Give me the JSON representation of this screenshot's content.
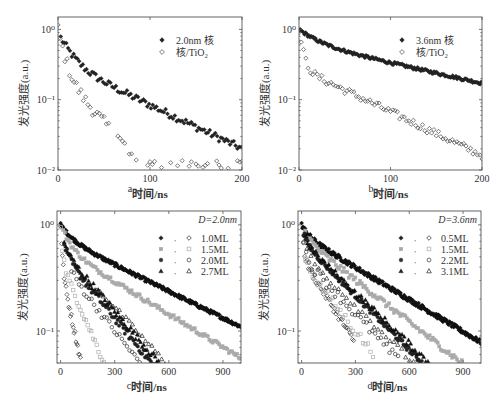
{
  "chart_data": [
    {
      "id": "a",
      "type": "scatter",
      "panel_label": "a",
      "title": "",
      "xlabel": "时间/ns",
      "ylabel": "发光强度(a.u.)",
      "xscale": "linear",
      "yscale": "log",
      "xlim": [
        0,
        200
      ],
      "ylim": [
        0.01,
        1.5
      ],
      "xticks": [
        0,
        100,
        200
      ],
      "yticks": [
        {
          "value": 1,
          "label": "10⁰"
        },
        {
          "value": 0.1,
          "label": "10⁻¹"
        },
        {
          "value": 0.01,
          "label": "10⁻²"
        }
      ],
      "legend_position": "upper right",
      "annotation": "",
      "series": [
        {
          "name": "2.0nm 核",
          "marker": "filled-diamond",
          "color": "#222222",
          "decay": {
            "a1": 0.55,
            "t1": 12,
            "a2": 0.35,
            "t2": 70,
            "start": 3,
            "end": 200,
            "step": 2,
            "noise": 0.12
          }
        },
        {
          "name": "核/TiO₂",
          "marker": "open-diamond",
          "color": "#444444",
          "decay": {
            "a1": 0.75,
            "t1": 6,
            "a2": 0.25,
            "t2": 30,
            "start": 0,
            "end": 200,
            "step": 2.5,
            "noise": 0.2,
            "floor": 0.0105,
            "sparse_after": 55
          }
        }
      ]
    },
    {
      "id": "b",
      "type": "scatter",
      "panel_label": "b",
      "title": "",
      "xlabel": "时间/ns",
      "ylabel": "发光强度(a.u.)",
      "xscale": "linear",
      "yscale": "log",
      "xlim": [
        0,
        200
      ],
      "ylim": [
        0.01,
        1.5
      ],
      "xticks": [
        0,
        100,
        200
      ],
      "yticks": [
        {
          "value": 1,
          "label": "10⁰"
        },
        {
          "value": 0.1,
          "label": "10⁻¹"
        },
        {
          "value": 0.01,
          "label": "10⁻²"
        }
      ],
      "legend_position": "upper right",
      "annotation": "",
      "series": [
        {
          "name": "3.6nm 核",
          "marker": "filled-diamond",
          "color": "#222222",
          "decay": {
            "a1": 0.35,
            "t1": 20,
            "a2": 0.65,
            "t2": 150,
            "start": 0,
            "end": 200,
            "step": 1.2,
            "noise": 0.05
          }
        },
        {
          "name": "核/TiO₂",
          "marker": "open-diamond",
          "color": "#444444",
          "decay": {
            "a1": 0.72,
            "t1": 4,
            "a2": 0.28,
            "t2": 70,
            "start": 0,
            "end": 200,
            "step": 2.5,
            "noise": 0.12
          }
        }
      ]
    },
    {
      "id": "c",
      "type": "scatter",
      "panel_label": "c",
      "title": "",
      "xlabel": "时间/ns",
      "ylabel": "发光强度(a.u.)",
      "xscale": "linear",
      "yscale": "log",
      "xlim": [
        -20,
        1000
      ],
      "ylim": [
        0.05,
        1.35
      ],
      "xticks": [
        0,
        300,
        600,
        900
      ],
      "yticks": [
        {
          "value": 1,
          "label": "10⁰"
        },
        {
          "value": 0.1,
          "label": "10⁻¹"
        }
      ],
      "legend_position": "upper right",
      "annotation": "D=2.0nm",
      "legend_rows": [
        {
          "label": "1.0ML",
          "filled": "filled-diamond",
          "open": "open-diamond",
          "color": "#222222"
        },
        {
          "label": "1.5ML",
          "filled": "filled-square",
          "open": "open-square",
          "color": "#aaaaaa"
        },
        {
          "label": "2.0ML",
          "filled": "filled-circle",
          "open": "open-circle",
          "color": "#333333"
        },
        {
          "label": "2.7ML",
          "filled": "filled-triangle",
          "open": "open-triangle",
          "color": "#222222"
        }
      ],
      "series": [
        {
          "name": "1.0ML core",
          "marker": "filled-diamond",
          "color": "#111111",
          "decay": {
            "a1": 0.25,
            "t1": 60,
            "a2": 0.75,
            "t2": 520,
            "start": 0,
            "end": 1000,
            "step": 4,
            "noise": 0.04
          }
        },
        {
          "name": "1.0ML core/TiO₂",
          "marker": "open-diamond",
          "color": "#333333",
          "decay": {
            "a1": 0.6,
            "t1": 8,
            "a2": 0.4,
            "t2": 55,
            "start": 0,
            "end": 115,
            "step": 5,
            "noise": 0.08
          }
        },
        {
          "name": "1.5ML core",
          "marker": "filled-square",
          "color": "#aaaaaa",
          "decay": {
            "a1": 0.4,
            "t1": 50,
            "a2": 0.6,
            "t2": 420,
            "start": 15,
            "end": 1000,
            "step": 9,
            "noise": 0.05
          }
        },
        {
          "name": "1.5ML core/TiO₂",
          "marker": "open-square",
          "color": "#b0b0b0",
          "decay": {
            "a1": 0.55,
            "t1": 10,
            "a2": 0.45,
            "t2": 110,
            "start": 0,
            "end": 320,
            "step": 10,
            "noise": 0.08
          }
        },
        {
          "name": "2.0ML core",
          "marker": "filled-circle",
          "color": "#222222",
          "decay": {
            "a1": 0.35,
            "t1": 25,
            "a2": 0.55,
            "t2": 210,
            "start": 20,
            "end": 560,
            "step": 8,
            "noise": 0.08
          }
        },
        {
          "name": "2.0ML core/TiO₂",
          "marker": "open-circle",
          "color": "#333333",
          "decay": {
            "a1": 0.4,
            "t1": 25,
            "a2": 0.45,
            "t2": 200,
            "start": 60,
            "end": 580,
            "step": 14,
            "noise": 0.08
          }
        },
        {
          "name": "2.7ML core",
          "marker": "filled-triangle",
          "color": "#111111",
          "decay": {
            "a1": 0.3,
            "t1": 25,
            "a2": 0.6,
            "t2": 220,
            "start": 20,
            "end": 600,
            "step": 9,
            "noise": 0.08
          }
        },
        {
          "name": "2.7ML core/TiO₂",
          "marker": "open-triangle",
          "color": "#222222",
          "decay": {
            "a1": 0.3,
            "t1": 25,
            "a2": 0.6,
            "t2": 235,
            "start": 200,
            "end": 680,
            "step": 18,
            "noise": 0.06
          }
        }
      ]
    },
    {
      "id": "d",
      "type": "scatter",
      "panel_label": "d",
      "title": "",
      "xlabel": "时间/ns",
      "ylabel": "发光强度(a.u.)",
      "xscale": "linear",
      "yscale": "log",
      "xlim": [
        -20,
        1000
      ],
      "ylim": [
        0.05,
        1.35
      ],
      "xticks": [
        0,
        300,
        600,
        900
      ],
      "yticks": [
        {
          "value": 1,
          "label": "10⁰"
        },
        {
          "value": 0.1,
          "label": "10⁻¹"
        }
      ],
      "legend_position": "upper right",
      "annotation": "D=3.6nm",
      "legend_rows": [
        {
          "label": "0.5ML",
          "filled": "filled-diamond",
          "open": "open-diamond",
          "color": "#222222"
        },
        {
          "label": "1.5ML",
          "filled": "filled-square",
          "open": "open-square",
          "color": "#aaaaaa"
        },
        {
          "label": "2.2ML",
          "filled": "filled-circle",
          "open": "open-circle",
          "color": "#333333"
        },
        {
          "label": "3.1ML",
          "filled": "filled-triangle",
          "open": "open-triangle",
          "color": "#222222"
        }
      ],
      "series": [
        {
          "name": "0.5ML core",
          "marker": "filled-diamond",
          "color": "#111111",
          "decay": {
            "a1": 0.2,
            "t1": 40,
            "a2": 0.8,
            "t2": 430,
            "start": 0,
            "end": 1000,
            "step": 4,
            "noise": 0.05
          }
        },
        {
          "name": "0.5ML core/TiO₂",
          "marker": "open-diamond",
          "color": "#333333",
          "decay": {
            "a1": 0.5,
            "t1": 10,
            "a2": 0.5,
            "t2": 160,
            "start": 10,
            "end": 290,
            "step": 7,
            "noise": 0.08
          }
        },
        {
          "name": "1.5ML core",
          "marker": "filled-square",
          "color": "#aaaaaa",
          "decay": {
            "a1": 0.25,
            "t1": 40,
            "a2": 0.75,
            "t2": 330,
            "start": 20,
            "end": 1000,
            "step": 9,
            "noise": 0.07
          }
        },
        {
          "name": "1.5ML core/TiO₂",
          "marker": "open-square",
          "color": "#b0b0b0",
          "decay": {
            "a1": 0.45,
            "t1": 15,
            "a2": 0.45,
            "t2": 200,
            "start": 20,
            "end": 400,
            "step": 14,
            "noise": 0.1
          }
        },
        {
          "name": "2.2ML core",
          "marker": "filled-circle",
          "color": "#222222",
          "decay": {
            "a1": 0.25,
            "t1": 25,
            "a2": 0.7,
            "t2": 255,
            "start": 10,
            "end": 820,
            "step": 6,
            "noise": 0.06
          }
        },
        {
          "name": "2.2ML core/TiO₂",
          "marker": "open-circle",
          "color": "#333333",
          "decay": {
            "a1": 0.3,
            "t1": 20,
            "a2": 0.5,
            "t2": 240,
            "start": 10,
            "end": 640,
            "step": 16,
            "noise": 0.1
          }
        },
        {
          "name": "3.1ML core",
          "marker": "filled-triangle",
          "color": "#111111",
          "decay": {
            "a1": 0.25,
            "t1": 25,
            "a2": 0.7,
            "t2": 270,
            "start": 20,
            "end": 800,
            "step": 12,
            "noise": 0.07
          }
        },
        {
          "name": "3.1ML core/TiO₂",
          "marker": "open-triangle",
          "color": "#222222",
          "decay": {
            "a1": 0.3,
            "t1": 25,
            "a2": 0.55,
            "t2": 260,
            "start": 30,
            "end": 880,
            "step": 22,
            "noise": 0.07
          }
        }
      ]
    }
  ],
  "layout": {
    "panels": [
      {
        "id": "a",
        "frame": {
          "x": 58,
          "y": 17,
          "w": 184,
          "h": 153
        },
        "svg": {
          "x": 0,
          "y": 0,
          "w": 250,
          "h": 205
        },
        "label_pos": {
          "x": 118,
          "y": 191
        }
      },
      {
        "id": "b",
        "frame": {
          "x": 299,
          "y": 17,
          "w": 183,
          "h": 153
        },
        "svg": {
          "x": 250,
          "y": 0,
          "w": 251,
          "h": 205
        },
        "label_pos": {
          "x": 359,
          "y": 191
        }
      },
      {
        "id": "c",
        "frame": {
          "x": 57,
          "y": 211,
          "w": 184,
          "h": 152
        },
        "svg": {
          "x": 0,
          "y": 200,
          "w": 250,
          "h": 209
        },
        "label_pos": {
          "x": 117,
          "y": 388
        }
      },
      {
        "id": "d",
        "frame": {
          "x": 298,
          "y": 211,
          "w": 183,
          "h": 152
        },
        "svg": {
          "x": 250,
          "y": 200,
          "w": 251,
          "h": 209
        },
        "label_pos": {
          "x": 358,
          "y": 388
        }
      }
    ]
  }
}
